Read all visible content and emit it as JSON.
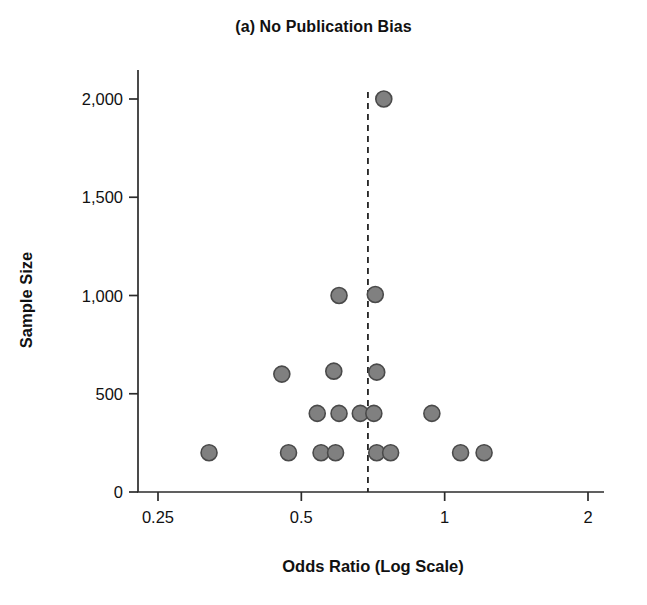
{
  "chart_data": {
    "type": "scatter",
    "title": "(a) No Publication Bias",
    "xlabel": "Odds Ratio (Log Scale)",
    "ylabel": "Sample Size",
    "x_scale": "log",
    "x_ticks": [
      0.25,
      0.5,
      1,
      2
    ],
    "x_tick_labels": [
      "0.25",
      "0.5",
      "1",
      "2"
    ],
    "y_ticks": [
      0,
      500,
      1000,
      1500,
      2000
    ],
    "y_tick_labels": [
      "0",
      "500",
      "1,000",
      "1,500",
      "2,000"
    ],
    "xlim": [
      0.22,
      2.25
    ],
    "ylim": [
      0,
      2100
    ],
    "grid": false,
    "legend": null,
    "marker": {
      "shape": "circle",
      "fill_color": "#808080",
      "edge_color": "#4a4a4a",
      "size_px": 16
    },
    "annotations": [
      {
        "type": "vertical-reference-line",
        "name": "pooled-effect-line",
        "x": 0.69,
        "style": "dashed",
        "color": "#222222"
      }
    ],
    "series": [
      {
        "name": "Studies",
        "points": [
          {
            "x": 0.32,
            "y": 200
          },
          {
            "x": 0.47,
            "y": 200
          },
          {
            "x": 0.55,
            "y": 200
          },
          {
            "x": 0.59,
            "y": 200
          },
          {
            "x": 0.72,
            "y": 200
          },
          {
            "x": 0.77,
            "y": 200
          },
          {
            "x": 1.08,
            "y": 200
          },
          {
            "x": 1.21,
            "y": 200
          },
          {
            "x": 0.54,
            "y": 400
          },
          {
            "x": 0.6,
            "y": 400
          },
          {
            "x": 0.665,
            "y": 400
          },
          {
            "x": 0.71,
            "y": 400
          },
          {
            "x": 0.94,
            "y": 400
          },
          {
            "x": 0.455,
            "y": 600
          },
          {
            "x": 0.585,
            "y": 615
          },
          {
            "x": 0.72,
            "y": 610
          },
          {
            "x": 0.6,
            "y": 1000
          },
          {
            "x": 0.715,
            "y": 1005
          },
          {
            "x": 0.745,
            "y": 2000
          }
        ]
      }
    ]
  }
}
